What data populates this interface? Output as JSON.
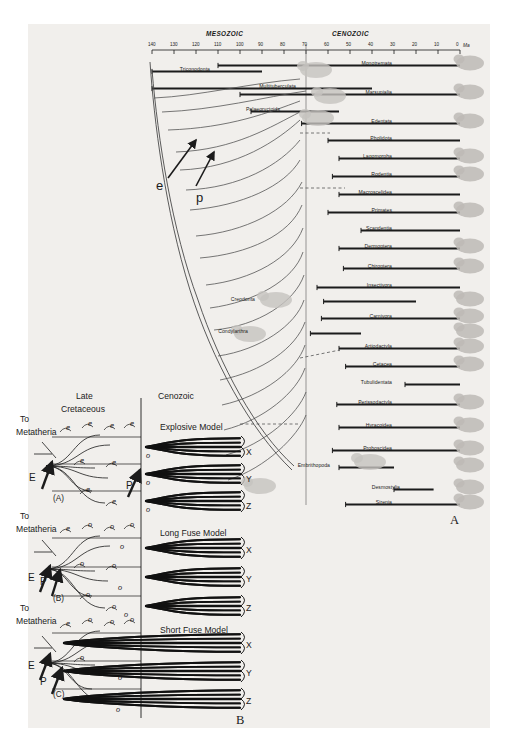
{
  "figure": {
    "panel_a_letter": "A",
    "panel_b_letter": "B"
  },
  "timescale": {
    "eras": [
      {
        "name": "MESOZOIC",
        "x": 232
      },
      {
        "name": "CENOZOIC",
        "x": 355
      }
    ],
    "unit_label": "Ma",
    "ticks": [
      "140",
      "130",
      "120",
      "110",
      "100",
      "90",
      "80",
      "70",
      "60",
      "50",
      "40",
      "30",
      "20",
      "10",
      "0"
    ],
    "range_start_ma": 140,
    "range_end_ma": 0,
    "kt_boundary_ma": 65
  },
  "panel_a": {
    "arrow_labels": [
      {
        "label": "e",
        "meaning": "eutherian-origin-arrow"
      },
      {
        "label": "p",
        "meaning": "placental-origin-arrow"
      }
    ],
    "taxa": [
      {
        "name": "Triconodonta",
        "label_x": 210,
        "label_y": 66,
        "label_anchor": "end"
      },
      {
        "name": "Monotremata",
        "label_x": 392,
        "label_y": 60,
        "label_anchor": "end"
      },
      {
        "name": "Multituberculata",
        "label_x": 296,
        "label_y": 83,
        "label_anchor": "end"
      },
      {
        "name": "Marsupialia",
        "label_x": 392,
        "label_y": 89,
        "label_anchor": "end"
      },
      {
        "name": "Palaeoryctoids",
        "label_x": 280,
        "label_y": 106,
        "label_anchor": "end"
      },
      {
        "name": "Edentata",
        "label_x": 392,
        "label_y": 118,
        "label_anchor": "end"
      },
      {
        "name": "Pholidota",
        "label_x": 392,
        "label_y": 135,
        "label_anchor": "end"
      },
      {
        "name": "Lagomorpha",
        "label_x": 392,
        "label_y": 153,
        "label_anchor": "end"
      },
      {
        "name": "Rodentia",
        "label_x": 392,
        "label_y": 171,
        "label_anchor": "end"
      },
      {
        "name": "Macroscelidea",
        "label_x": 392,
        "label_y": 189,
        "label_anchor": "end"
      },
      {
        "name": "Primates",
        "label_x": 392,
        "label_y": 207,
        "label_anchor": "end"
      },
      {
        "name": "Scandentia",
        "label_x": 392,
        "label_y": 225,
        "label_anchor": "end"
      },
      {
        "name": "Dermoptera",
        "label_x": 392,
        "label_y": 243,
        "label_anchor": "end"
      },
      {
        "name": "Chiroptera",
        "label_x": 392,
        "label_y": 263,
        "label_anchor": "end"
      },
      {
        "name": "Insectivora",
        "label_x": 392,
        "label_y": 282,
        "label_anchor": "end"
      },
      {
        "name": "Creodonta",
        "label_x": 255,
        "label_y": 296,
        "label_anchor": "end"
      },
      {
        "name": "Carnivora",
        "label_x": 392,
        "label_y": 313,
        "label_anchor": "end"
      },
      {
        "name": "Condylarthra",
        "label_x": 248,
        "label_y": 328,
        "label_anchor": "end"
      },
      {
        "name": "Artiodactyla",
        "label_x": 392,
        "label_y": 343,
        "label_anchor": "end"
      },
      {
        "name": "Cetacea",
        "label_x": 392,
        "label_y": 361,
        "label_anchor": "end"
      },
      {
        "name": "Tubulidentata",
        "label_x": 392,
        "label_y": 379,
        "label_anchor": "end"
      },
      {
        "name": "Perissodactyla",
        "label_x": 392,
        "label_y": 399,
        "label_anchor": "end"
      },
      {
        "name": "Hyracoidea",
        "label_x": 392,
        "label_y": 422,
        "label_anchor": "end"
      },
      {
        "name": "Proboscidea",
        "label_x": 392,
        "label_y": 445,
        "label_anchor": "end"
      },
      {
        "name": "Embrithopoda",
        "label_x": 330,
        "label_y": 462,
        "label_anchor": "end"
      },
      {
        "name": "Desmostylia",
        "label_x": 400,
        "label_y": 484,
        "label_anchor": "end"
      },
      {
        "name": "Sirenia",
        "label_x": 392,
        "label_y": 499,
        "label_anchor": "end"
      }
    ]
  },
  "panel_b": {
    "column_headers": [
      "Late",
      "Cretaceous",
      "Cenozoic"
    ],
    "to_metatheria_label": "To\nMetatheria",
    "to_label": "To",
    "metatheria_label": "Metatheria",
    "models": [
      {
        "id": "A",
        "caption": "(A)",
        "title": "Explosive Model",
        "origin_arrows": [
          "E"
        ],
        "terminal_labels": [
          "X",
          "Y",
          "Z"
        ],
        "stem_letters": [
          "e",
          "e",
          "e",
          "e",
          "e",
          "e",
          "e",
          "e"
        ],
        "cenozoic_letters": [
          "o",
          "o",
          "o"
        ],
        "placental_arrow": "P"
      },
      {
        "id": "B",
        "caption": "(B)",
        "title": "Long Fuse Model",
        "origin_arrows": [
          "E",
          "P"
        ],
        "terminal_labels": [
          "X",
          "Y",
          "Z"
        ],
        "stem_letters": [
          "e",
          "o",
          "o",
          "o",
          "o",
          "o",
          "o",
          "o"
        ],
        "cenozoic_letters": [
          "o",
          "o",
          "o"
        ],
        "placental_arrow": "P"
      },
      {
        "id": "C",
        "caption": "(C)",
        "title": "Short Fuse Model",
        "origin_arrows": [
          "E",
          "P"
        ],
        "terminal_labels": [
          "X",
          "Y",
          "Z"
        ],
        "stem_letters": [
          "e",
          "o",
          "o",
          "o",
          "o"
        ],
        "cenozoic_letters": [
          "o",
          "o"
        ],
        "placental_arrow": "P"
      }
    ]
  },
  "chart_data": {
    "type": "line",
    "xlabel": "Ma",
    "ylabel": "",
    "xlim": [
      140,
      0
    ],
    "grid": false,
    "legend": "none",
    "panels": [
      {
        "id": "A",
        "description": "Time-calibrated phylogeny of mammalian orders from 140 Ma to present",
        "x_ticks": [
          140,
          130,
          120,
          110,
          100,
          90,
          80,
          70,
          60,
          50,
          40,
          30,
          20,
          10,
          0
        ],
        "era_spans": [
          {
            "name": "MESOZOIC",
            "from": 140,
            "to": 65
          },
          {
            "name": "CENOZOIC",
            "from": 65,
            "to": 0
          }
        ],
        "kt_boundary": 65,
        "lineages": [
          {
            "name": "Triconodonta",
            "first_appearance": 140,
            "last_appearance": 90
          },
          {
            "name": "Monotremata",
            "first_appearance": 110,
            "last_appearance": 0
          },
          {
            "name": "Multituberculata",
            "first_appearance": 140,
            "last_appearance": 40
          },
          {
            "name": "Marsupialia",
            "first_appearance": 100,
            "last_appearance": 0
          },
          {
            "name": "Palaeoryctoids",
            "first_appearance": 95,
            "last_appearance": 55
          },
          {
            "name": "Edentata",
            "first_appearance": 72,
            "last_appearance": 0
          },
          {
            "name": "Pholidota",
            "first_appearance": 60,
            "last_appearance": 0
          },
          {
            "name": "Lagomorpha",
            "first_appearance": 55,
            "last_appearance": 0
          },
          {
            "name": "Rodentia",
            "first_appearance": 58,
            "last_appearance": 0
          },
          {
            "name": "Macroscelidea",
            "first_appearance": 55,
            "last_appearance": 0
          },
          {
            "name": "Primates",
            "first_appearance": 60,
            "last_appearance": 0
          },
          {
            "name": "Scandentia",
            "first_appearance": 45,
            "last_appearance": 0
          },
          {
            "name": "Dermoptera",
            "first_appearance": 55,
            "last_appearance": 0
          },
          {
            "name": "Chiroptera",
            "first_appearance": 53,
            "last_appearance": 0
          },
          {
            "name": "Insectivora",
            "first_appearance": 65,
            "last_appearance": 0
          },
          {
            "name": "Creodonta",
            "first_appearance": 62,
            "last_appearance": 20
          },
          {
            "name": "Carnivora",
            "first_appearance": 63,
            "last_appearance": 0
          },
          {
            "name": "Condylarthra",
            "first_appearance": 68,
            "last_appearance": 45
          },
          {
            "name": "Artiodactyla",
            "first_appearance": 55,
            "last_appearance": 0
          },
          {
            "name": "Cetacea",
            "first_appearance": 52,
            "last_appearance": 0
          },
          {
            "name": "Tubulidentata",
            "first_appearance": 25,
            "last_appearance": 0
          },
          {
            "name": "Perissodactyla",
            "first_appearance": 56,
            "last_appearance": 0
          },
          {
            "name": "Hyracoidea",
            "first_appearance": 55,
            "last_appearance": 0
          },
          {
            "name": "Proboscidea",
            "first_appearance": 58,
            "last_appearance": 0
          },
          {
            "name": "Embrithopoda",
            "first_appearance": 55,
            "last_appearance": 30
          },
          {
            "name": "Desmostylia",
            "first_appearance": 30,
            "last_appearance": 12
          },
          {
            "name": "Sirenia",
            "first_appearance": 52,
            "last_appearance": 0
          }
        ]
      },
      {
        "id": "B",
        "description": "Three competing models of placental diversification across the K/T boundary",
        "models": [
          "Explosive Model",
          "Long Fuse Model",
          "Short Fuse Model"
        ],
        "time_columns": [
          "Late Cretaceous",
          "Cenozoic"
        ],
        "clades": [
          "X",
          "Y",
          "Z"
        ]
      }
    ]
  }
}
